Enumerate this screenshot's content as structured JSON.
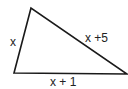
{
  "diagram": {
    "type": "triangle",
    "sides": {
      "left": "x",
      "hypotenuse": "x +5",
      "base": "x + 1"
    },
    "colors": {
      "stroke": "#1a1a1a",
      "text": "#222222",
      "background": "#ffffff"
    }
  }
}
